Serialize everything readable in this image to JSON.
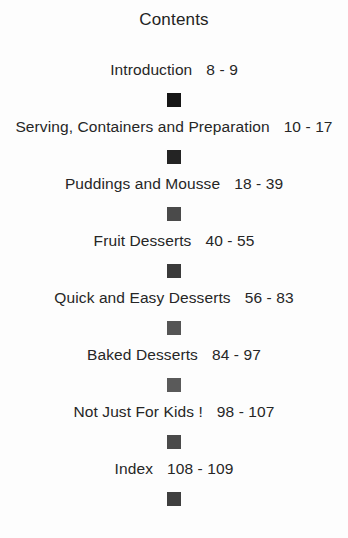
{
  "document": {
    "title": "Contents",
    "background_color": "#fdfdfd",
    "text_color": "#262626",
    "bullet_icon": "filled-square-bullet"
  },
  "contents": {
    "entries": [
      {
        "label": "Introduction",
        "pages": "8 - 9"
      },
      {
        "label": "Serving, Containers and Preparation",
        "pages": "10 - 17"
      },
      {
        "label": "Puddings and Mousse",
        "pages": "18 - 39"
      },
      {
        "label": "Fruit Desserts",
        "pages": "40 - 55"
      },
      {
        "label": "Quick and Easy Desserts",
        "pages": "56 - 83"
      },
      {
        "label": "Baked Desserts",
        "pages": "84 - 97"
      },
      {
        "label": "Not Just For Kids !",
        "pages": "98 - 107"
      },
      {
        "label": "Index",
        "pages": "108 - 109"
      }
    ]
  }
}
